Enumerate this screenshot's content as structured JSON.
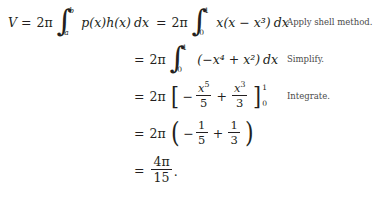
{
  "document": {
    "kind": "math-derivation",
    "topic": "Volume by the shell method",
    "text_color": "#231f20",
    "note_color": "#4a4a4a",
    "background": "#ffffff"
  },
  "lines": [
    {
      "id": "line-1",
      "lhs": "V",
      "equals": "=",
      "coefficient": "2",
      "pi": "π",
      "integral": {
        "lower": "a",
        "upper": "b"
      },
      "integrand": "p(x)h(x)",
      "differential": "dx",
      "second_equals": "=",
      "second_coefficient": "2",
      "second_integral": {
        "lower": "0",
        "upper": "1"
      },
      "second_integrand": "x(x − x³)",
      "note": "Apply shell method."
    },
    {
      "id": "line-2",
      "equals": "=",
      "coefficient": "2",
      "pi": "π",
      "integral": {
        "lower": "0",
        "upper": "1"
      },
      "integrand": "(−x⁴ + x²)",
      "differential": "dx",
      "note": "Simplify."
    },
    {
      "id": "line-3",
      "equals": "=",
      "coefficient": "2",
      "pi": "π",
      "terms": [
        {
          "sign": "−",
          "num_base": "x",
          "num_exp": "5",
          "den": "5"
        },
        {
          "sign": "+",
          "num_base": "x",
          "num_exp": "3",
          "den": "3"
        }
      ],
      "eval_limits": {
        "lower": "0",
        "upper": "1"
      },
      "note": "Integrate."
    },
    {
      "id": "line-4",
      "equals": "=",
      "coefficient": "2",
      "pi": "π",
      "terms": [
        {
          "sign": "−",
          "num": "1",
          "den": "5"
        },
        {
          "sign": "+",
          "num": "1",
          "den": "3"
        }
      ],
      "note": ""
    },
    {
      "id": "line-5",
      "equals": "=",
      "result": {
        "num_coefficient": "4",
        "num_pi": "π",
        "den": "15"
      },
      "terminator": ".",
      "note": ""
    }
  ],
  "symbols": {
    "integral_glyph": "∫",
    "minus": "−",
    "plus": "+",
    "equals": "=",
    "pi": "π",
    "bracket_left": "[",
    "bracket_right": "]",
    "paren_left": "(",
    "paren_right": ")",
    "eval_bar": "|"
  }
}
